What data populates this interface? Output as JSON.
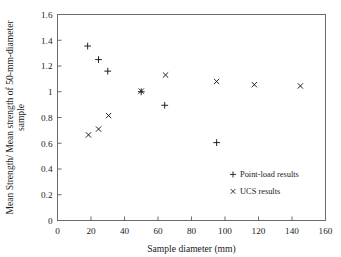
{
  "chart_data": {
    "type": "scatter",
    "title": "",
    "xlabel": "Sample diameter (mm)",
    "ylabel": "Mean Strength/ Mean strength of 50-mm-diameter sample",
    "xlim": [
      0,
      160
    ],
    "ylim": [
      0,
      1.6
    ],
    "xticks": [
      "0",
      "20",
      "40",
      "60",
      "80",
      "100",
      "120",
      "140",
      "160"
    ],
    "xtick_values": [
      0,
      20,
      40,
      60,
      80,
      100,
      120,
      140,
      160
    ],
    "yticks": [
      "0",
      "0.2",
      "0.4",
      "0.6",
      "0.8",
      "1",
      "1.2",
      "1.4",
      "1.6"
    ],
    "ytick_values": [
      0,
      0.2,
      0.4,
      0.6,
      0.8,
      1.0,
      1.2,
      1.4,
      1.6
    ],
    "grid": false,
    "legend_position": "lower-right",
    "series": [
      {
        "name": "Point-load results",
        "marker": "plus",
        "color": "#181818",
        "points": [
          {
            "x": 18.0,
            "y": 1.355
          },
          {
            "x": 24.5,
            "y": 1.25
          },
          {
            "x": 30.0,
            "y": 1.16
          },
          {
            "x": 50.0,
            "y": 1.0
          },
          {
            "x": 64.0,
            "y": 0.895
          },
          {
            "x": 95.0,
            "y": 0.605
          }
        ]
      },
      {
        "name": "UCS results",
        "marker": "cross",
        "color": "#181818",
        "points": [
          {
            "x": 18.5,
            "y": 0.665
          },
          {
            "x": 24.5,
            "y": 0.71
          },
          {
            "x": 30.5,
            "y": 0.815
          },
          {
            "x": 50.0,
            "y": 1.005
          },
          {
            "x": 64.5,
            "y": 1.13
          },
          {
            "x": 95.0,
            "y": 1.08
          },
          {
            "x": 117.5,
            "y": 1.055
          },
          {
            "x": 145.0,
            "y": 1.045
          }
        ]
      }
    ]
  },
  "legend": {
    "entries": [
      {
        "marker": "plus",
        "label": "Point-load results"
      },
      {
        "marker": "cross",
        "label": "UCS results"
      }
    ]
  },
  "colors": {
    "axis": "#6b6b6b",
    "marker": "#181818",
    "background": "#ffffff",
    "text": "#1a1a1a"
  }
}
